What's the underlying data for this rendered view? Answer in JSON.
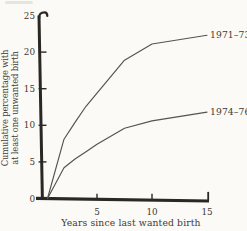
{
  "figure": {
    "background": "#fbfaf7",
    "ink": "#3f3b33",
    "axis_color": "#2b2823",
    "curve_color": "#57534a"
  },
  "chart_data": {
    "type": "line",
    "title": "",
    "xlabel": "Years since last wanted birth",
    "ylabel": "Cumulative percentage with at least one unwanted birth",
    "ylabel_lines": [
      "Cumulative percentage with",
      "at least one unwanted birth"
    ],
    "xlim": [
      0,
      15
    ],
    "ylim": [
      0,
      25
    ],
    "xticks": [
      5,
      10,
      15
    ],
    "yticks": [
      0,
      5,
      10,
      15,
      20,
      25
    ],
    "grid": false,
    "legend_position": "end-of-line labels at right",
    "series": [
      {
        "name": "1971–73",
        "points": [
          [
            0.5,
            0
          ],
          [
            2,
            8.1
          ],
          [
            3,
            10.4
          ],
          [
            4,
            12.6
          ],
          [
            5,
            14.4
          ],
          [
            7.5,
            18.9
          ],
          [
            10,
            21.1
          ],
          [
            15,
            22.3
          ]
        ]
      },
      {
        "name": "1974–76",
        "points": [
          [
            0.5,
            0
          ],
          [
            2,
            4.2
          ],
          [
            3,
            5.4
          ],
          [
            4,
            6.4
          ],
          [
            5,
            7.4
          ],
          [
            7.5,
            9.6
          ],
          [
            10,
            10.6
          ],
          [
            15,
            11.8
          ]
        ]
      }
    ]
  }
}
